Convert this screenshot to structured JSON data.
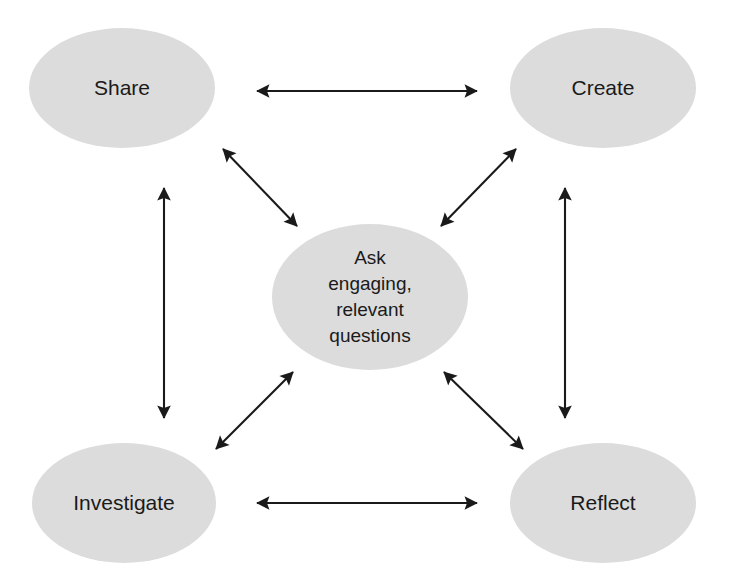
{
  "diagram": {
    "type": "hub-and-spoke-cycle",
    "background_color": "#ffffff",
    "node_fill_color": "#dcdcdc",
    "arrow_color": "#1a1a1a",
    "text_color": "#1a1a1a",
    "center_node": {
      "id": "ask",
      "label": "Ask\nengaging,\nrelevant\nquestions",
      "label_lines": [
        "Ask",
        "engaging,",
        "relevant",
        "questions"
      ],
      "shape": "ellipse",
      "cx": 370,
      "cy": 297,
      "rx": 98,
      "ry": 73
    },
    "corner_nodes": [
      {
        "id": "share",
        "label": "Share",
        "shape": "ellipse",
        "position": "top-left",
        "cx": 122,
        "cy": 88,
        "rx": 93,
        "ry": 60
      },
      {
        "id": "create",
        "label": "Create",
        "shape": "ellipse",
        "position": "top-right",
        "cx": 603,
        "cy": 88,
        "rx": 93,
        "ry": 60
      },
      {
        "id": "investigate",
        "label": "Investigate",
        "shape": "ellipse",
        "position": "bottom-left",
        "cx": 124,
        "cy": 503,
        "rx": 92,
        "ry": 60
      },
      {
        "id": "reflect",
        "label": "Reflect",
        "shape": "ellipse",
        "position": "bottom-right",
        "cx": 603,
        "cy": 503,
        "rx": 93,
        "ry": 60
      }
    ],
    "connectors": [
      {
        "id": "share-create",
        "from": "share",
        "to": "create",
        "direction": "bidirectional",
        "orientation": "horizontal",
        "x1": 257,
        "y1": 91,
        "x2": 477,
        "y2": 91
      },
      {
        "id": "investigate-reflect",
        "from": "investigate",
        "to": "reflect",
        "direction": "bidirectional",
        "orientation": "horizontal",
        "x1": 257,
        "y1": 503,
        "x2": 477,
        "y2": 503
      },
      {
        "id": "share-investigate",
        "from": "share",
        "to": "investigate",
        "direction": "bidirectional",
        "orientation": "vertical",
        "x1": 164,
        "y1": 188,
        "x2": 164,
        "y2": 418
      },
      {
        "id": "create-reflect",
        "from": "create",
        "to": "reflect",
        "direction": "bidirectional",
        "orientation": "vertical",
        "x1": 565,
        "y1": 188,
        "x2": 565,
        "y2": 418
      },
      {
        "id": "share-ask",
        "from": "share",
        "to": "ask",
        "direction": "bidirectional",
        "orientation": "diagonal",
        "x1": 223,
        "y1": 149,
        "x2": 297,
        "y2": 226
      },
      {
        "id": "create-ask",
        "from": "create",
        "to": "ask",
        "direction": "bidirectional",
        "orientation": "diagonal",
        "x1": 516,
        "y1": 149,
        "x2": 441,
        "y2": 226
      },
      {
        "id": "investigate-ask",
        "from": "investigate",
        "to": "ask",
        "direction": "bidirectional",
        "orientation": "diagonal",
        "x1": 216,
        "y1": 449,
        "x2": 293,
        "y2": 372
      },
      {
        "id": "reflect-ask",
        "from": "reflect",
        "to": "ask",
        "direction": "bidirectional",
        "orientation": "diagonal",
        "x1": 523,
        "y1": 449,
        "x2": 444,
        "y2": 372
      }
    ]
  }
}
